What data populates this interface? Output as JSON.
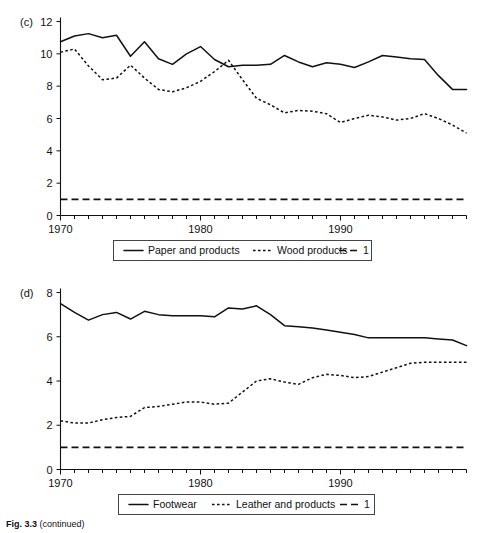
{
  "figure": {
    "caption_label": "Fig. 3.3",
    "caption_text": "(continued)"
  },
  "panels": [
    {
      "tag": "(c)",
      "legend": [
        {
          "label": "Paper and products",
          "style": "solid"
        },
        {
          "label": "Wood products",
          "style": "dotted"
        },
        {
          "label": "1",
          "style": "dashed"
        }
      ]
    },
    {
      "tag": "(d)",
      "legend": [
        {
          "label": "Footwear",
          "style": "solid"
        },
        {
          "label": "Leather and products",
          "style": "dotted"
        },
        {
          "label": "1",
          "style": "dashed"
        }
      ]
    }
  ],
  "chart_data": [
    {
      "type": "line",
      "title": "(c)",
      "xlabel": "",
      "ylabel": "",
      "xlim": [
        1970,
        1999
      ],
      "ylim": [
        0,
        12
      ],
      "yticks": [
        0,
        2,
        4,
        6,
        8,
        10,
        12
      ],
      "ytick_labels": [
        "0",
        "2",
        "4",
        "6",
        "8",
        "10",
        "12"
      ],
      "xticks": [
        1970,
        1980,
        1990
      ],
      "xtick_labels": [
        "1970",
        "1980",
        "1990"
      ],
      "grid": false,
      "legend_position": "below",
      "x": [
        1970,
        1971,
        1972,
        1973,
        1974,
        1975,
        1976,
        1977,
        1978,
        1979,
        1980,
        1981,
        1982,
        1983,
        1984,
        1985,
        1986,
        1987,
        1988,
        1989,
        1990,
        1991,
        1992,
        1993,
        1994,
        1995,
        1996,
        1997,
        1998,
        1999
      ],
      "series": [
        {
          "name": "Paper and products",
          "style": "solid",
          "values": [
            10.75,
            11.1,
            11.25,
            11.0,
            11.15,
            9.85,
            10.75,
            9.7,
            9.35,
            10.0,
            10.45,
            9.65,
            9.2,
            9.3,
            9.3,
            9.35,
            9.9,
            9.5,
            9.2,
            9.45,
            9.35,
            9.15,
            9.5,
            9.9,
            9.8,
            9.7,
            9.65,
            8.65,
            7.8,
            7.8
          ]
        },
        {
          "name": "Wood products",
          "style": "dotted",
          "values": [
            10.1,
            10.3,
            9.25,
            8.4,
            8.5,
            9.3,
            8.5,
            7.8,
            7.65,
            7.9,
            8.3,
            8.9,
            9.6,
            8.4,
            7.25,
            6.85,
            6.35,
            6.5,
            6.45,
            6.3,
            5.75,
            6.0,
            6.2,
            6.1,
            5.9,
            6.0,
            6.3,
            6.0,
            5.6,
            5.1
          ]
        },
        {
          "name": "1",
          "style": "dashed",
          "values": [
            1,
            1,
            1,
            1,
            1,
            1,
            1,
            1,
            1,
            1,
            1,
            1,
            1,
            1,
            1,
            1,
            1,
            1,
            1,
            1,
            1,
            1,
            1,
            1,
            1,
            1,
            1,
            1,
            1,
            1
          ]
        }
      ]
    },
    {
      "type": "line",
      "title": "(d)",
      "xlabel": "",
      "ylabel": "",
      "xlim": [
        1970,
        1999
      ],
      "ylim": [
        0,
        8
      ],
      "yticks": [
        0,
        2,
        4,
        6,
        8
      ],
      "ytick_labels": [
        "0",
        "2",
        "4",
        "6",
        "8"
      ],
      "xticks": [
        1970,
        1980,
        1990
      ],
      "xtick_labels": [
        "1970",
        "1980",
        "1990"
      ],
      "grid": false,
      "legend_position": "below",
      "x": [
        1970,
        1971,
        1972,
        1973,
        1974,
        1975,
        1976,
        1977,
        1978,
        1979,
        1980,
        1981,
        1982,
        1983,
        1984,
        1985,
        1986,
        1987,
        1988,
        1989,
        1990,
        1991,
        1992,
        1993,
        1994,
        1995,
        1996,
        1997,
        1998,
        1999
      ],
      "series": [
        {
          "name": "Footwear",
          "style": "solid",
          "values": [
            7.5,
            7.1,
            6.75,
            7.0,
            7.1,
            6.8,
            7.15,
            7.0,
            6.95,
            6.95,
            6.95,
            6.9,
            7.3,
            7.25,
            7.4,
            7.0,
            6.5,
            6.45,
            6.4,
            6.3,
            6.2,
            6.1,
            5.95,
            5.95,
            5.95,
            5.95,
            5.95,
            5.9,
            5.85,
            5.6
          ]
        },
        {
          "name": "Leather and products",
          "style": "dotted",
          "values": [
            2.2,
            2.1,
            2.1,
            2.25,
            2.35,
            2.4,
            2.8,
            2.85,
            2.95,
            3.05,
            3.05,
            2.95,
            3.0,
            3.5,
            4.0,
            4.1,
            3.95,
            3.85,
            4.15,
            4.3,
            4.25,
            4.15,
            4.2,
            4.4,
            4.6,
            4.8,
            4.85,
            4.85,
            4.85,
            4.85
          ]
        },
        {
          "name": "1",
          "style": "dashed",
          "values": [
            1,
            1,
            1,
            1,
            1,
            1,
            1,
            1,
            1,
            1,
            1,
            1,
            1,
            1,
            1,
            1,
            1,
            1,
            1,
            1,
            1,
            1,
            1,
            1,
            1,
            1,
            1,
            1,
            1,
            1
          ]
        }
      ]
    }
  ]
}
